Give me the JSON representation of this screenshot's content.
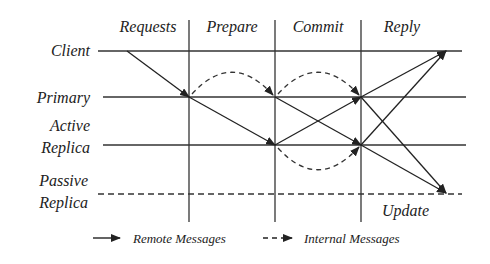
{
  "phases": [
    {
      "label": "Requests",
      "x": 148
    },
    {
      "label": "Prepare",
      "x": 232
    },
    {
      "label": "Commit",
      "x": 318
    },
    {
      "label": "Reply",
      "x": 402
    }
  ],
  "roles": {
    "client": {
      "line1": "Client",
      "line2": ""
    },
    "primary": {
      "line1": "Primary",
      "line2": ""
    },
    "active": {
      "line1": "Active",
      "line2": "Replica"
    },
    "passive": {
      "line1": "Passive",
      "line2": "Replica"
    }
  },
  "annotations": {
    "update": "Update"
  },
  "legend": {
    "remote": "Remote Messages",
    "internal": "Internal Messages"
  },
  "colors": {
    "line": "#333333",
    "text": "#222222"
  }
}
